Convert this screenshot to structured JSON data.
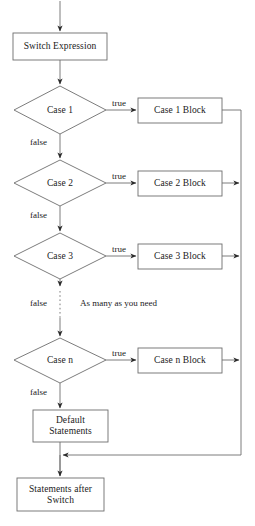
{
  "diagram": {
    "stroke_color": "#555555",
    "text_color": "#1a1a1a",
    "background_color": "#ffffff"
  },
  "nodes": {
    "switch_expression": {
      "label": "Switch Expression",
      "shape": "rect"
    },
    "case1": {
      "label": "Case 1",
      "shape": "diamond"
    },
    "case2": {
      "label": "Case 2",
      "shape": "diamond"
    },
    "case3": {
      "label": "Case 3",
      "shape": "diamond"
    },
    "casen": {
      "label": "Case n",
      "shape": "diamond"
    },
    "case1_block": {
      "label": "Case 1 Block",
      "shape": "rect"
    },
    "case2_block": {
      "label": "Case 2 Block",
      "shape": "rect"
    },
    "case3_block": {
      "label": "Case 3 Block",
      "shape": "rect"
    },
    "casen_block": {
      "label": "Case n Block",
      "shape": "rect"
    },
    "default_statements": {
      "label": "Default\nStatements",
      "shape": "rect"
    },
    "statements_after_switch": {
      "label": "Statements after\nSwitch",
      "shape": "rect"
    }
  },
  "edge_labels": {
    "true_1": "true",
    "true_2": "true",
    "true_3": "true",
    "true_n": "true",
    "false_1": "false",
    "false_2": "false",
    "false_3": "false",
    "false_n": "false"
  },
  "annotations": {
    "ellipsis_note": "As many as you need"
  }
}
